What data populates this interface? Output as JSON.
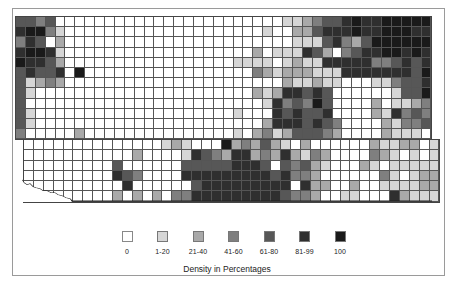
{
  "legend": {
    "title": "Density in Percentages",
    "items": [
      {
        "label": "0",
        "level": 0,
        "color": "#ffffff"
      },
      {
        "label": "1-20",
        "level": 1,
        "color": "#d6d6d6"
      },
      {
        "label": "21-40",
        "level": 2,
        "color": "#a9a9a9"
      },
      {
        "label": "41-60",
        "level": 3,
        "color": "#7f7f7f"
      },
      {
        "label": "61-80",
        "level": 4,
        "color": "#575757"
      },
      {
        "label": "81-99",
        "level": 5,
        "color": "#2f2f2f"
      },
      {
        "label": "100",
        "level": 6,
        "color": "#1a1a1a"
      }
    ]
  },
  "chart_data": {
    "type": "heatmap",
    "title": "",
    "legend_title": "Density in Percentages",
    "legend_position": "bottom",
    "categories": [
      "0",
      "1-20",
      "21-40",
      "41-60",
      "61-80",
      "81-99",
      "100"
    ],
    "level_colors": [
      "#ffffff",
      "#d6d6d6",
      "#a9a9a9",
      "#7f7f7f",
      "#575757",
      "#2f2f2f",
      "#1a1a1a"
    ],
    "grid_on": true,
    "upper_block": {
      "cols": 42,
      "rows": [
        "443400000000000000000000000112344565566666",
        "566310000000000000000000010022455565566655",
        "354020000000000000000000000011145324666666",
        "566510000000000000000000201115420345566565",
        "655420000000000000000011110121155555334545",
        "454450600000000000000000321222111555555546",
        "412320000000000000000000000211211000113445",
        "410000000000000000000000212554540000001446",
        "400000000000000000000000015343640000201123",
        "410000000000000000000010005454450000215343",
        "410000000000000000000000025554543000021334",
        "300000200000000000000010231244432000021110"
      ]
    },
    "lower_block": {
      "cols": 42,
      "rows": [
        "000000000000001210006232421020000002112201",
        "000000000002000015432552325213200003210101",
        "000000000400000044444555404342100021011111",
        "000000000543000055555555545332000000310122",
        "000000000050000004555555555052200200111122",
        "000000000202020335555555554332001100052111"
      ]
    }
  }
}
